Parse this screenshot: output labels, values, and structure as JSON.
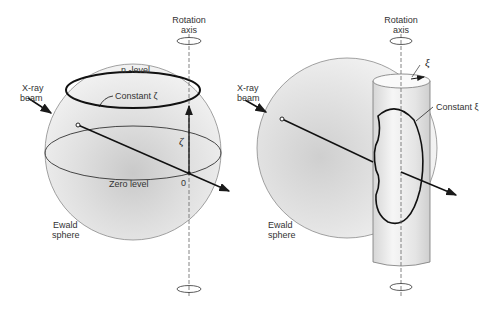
{
  "left_panel": {
    "rotation_axis_label_line1": "Rotation",
    "rotation_axis_label_line2": "axis",
    "xray_label_line1": "X-ray",
    "xray_label_line2": "beam",
    "n_level_label": "n -level",
    "constant_label": "Constant ζ",
    "zeta_symbol": "ζ",
    "zero_level_label": "Zero level",
    "origin_label": "0",
    "ewald_label_line1": "Ewald",
    "ewald_label_line2": "sphere"
  },
  "right_panel": {
    "rotation_axis_label_line1": "Rotation",
    "rotation_axis_label_line2": "axis",
    "xi_symbol": "ξ",
    "xray_label_line1": "X-ray",
    "xray_label_line2": "beam",
    "constant_label": "Constant ξ",
    "ewald_label_line1": "Ewald",
    "ewald_label_line2": "sphere"
  },
  "colors": {
    "sphere_fill": "#e2e2e2",
    "sphere_edge": "#8a8a8a",
    "line": "#1a1a1a",
    "cylinder": "#ececec"
  }
}
